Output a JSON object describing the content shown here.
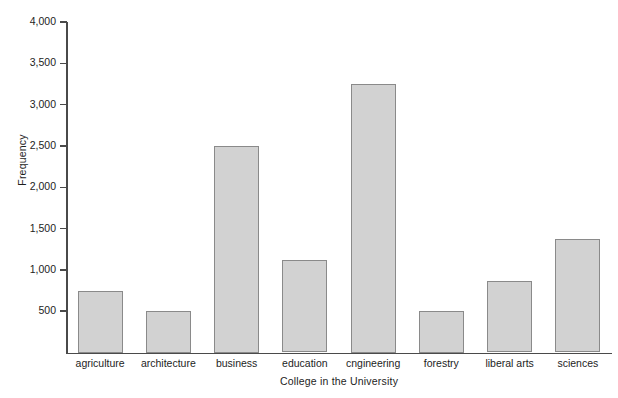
{
  "chart_data": {
    "type": "bar",
    "title": "",
    "xlabel": "College in the University",
    "ylabel": "Frequency",
    "categories": [
      "agriculture",
      "architecture",
      "business",
      "education",
      "cngineering",
      "forestry",
      "liberal arts",
      "sciences"
    ],
    "values": [
      750,
      500,
      2500,
      1120,
      3250,
      500,
      870,
      1370
    ],
    "ylim": [
      0,
      4000
    ],
    "ytick_values": [
      500,
      1000,
      1500,
      2000,
      2500,
      3000,
      3500,
      4000
    ],
    "ytick_labels": [
      "500",
      "1,000",
      "1,500",
      "2,000",
      "2,500",
      "3,000",
      "3,500",
      "4,000"
    ],
    "grid": false,
    "legend": false,
    "bar_fill_color": "#d2d2d2",
    "bar_edge_color": "#8a8a8a",
    "axis_color": "#4a4a4a"
  }
}
